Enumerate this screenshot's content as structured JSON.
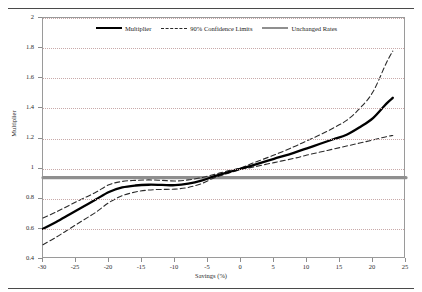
{
  "document": {
    "top_partial_text": "",
    "has_top_rule": true,
    "has_bottom_rule": true
  },
  "legend": {
    "position": "top-inside",
    "entries": [
      {
        "label": "Multiplier",
        "style": "solid",
        "color": "#000000"
      },
      {
        "label": "90% Confidence Limits",
        "style": "dashed",
        "color": "#2b2b2b"
      },
      {
        "label": "Unchanged Rates",
        "style": "thick-solid",
        "color": "#8f8f8f"
      }
    ]
  },
  "chart_data": {
    "type": "line",
    "title": "",
    "xlabel": "Savings (%)",
    "ylabel": "Multiplier",
    "xlim": [
      -30,
      25
    ],
    "ylim": [
      0.4,
      2.0
    ],
    "xticks": [
      -30,
      -25,
      -20,
      -15,
      -10,
      -5,
      0,
      5,
      10,
      15,
      20,
      25
    ],
    "xticklabels": [
      "-30",
      "-25",
      "-20",
      "-15",
      "-10",
      "-5",
      "0",
      "5",
      "10",
      "15",
      "20",
      "25"
    ],
    "yticks": [
      0.4,
      0.6,
      0.8,
      1.0,
      1.2,
      1.4,
      1.6,
      1.8,
      2.0
    ],
    "yticklabels": [
      "0.4",
      "0.6",
      "0.8",
      "1",
      "1.2",
      "1.4",
      "1.6",
      "1.8",
      "2"
    ],
    "grid": "horizontal-dotted",
    "legend_position": "top-inside",
    "series": [
      {
        "name": "Multiplier",
        "style": "solid",
        "color": "#000000",
        "x": [
          -30,
          -28,
          -26,
          -24,
          -22,
          -20,
          -18,
          -16,
          -14,
          -12,
          -10,
          -8,
          -6,
          -4,
          -2,
          0,
          2,
          5,
          8,
          10,
          12,
          14,
          16,
          18,
          20,
          22,
          23
        ],
        "y": [
          0.6,
          0.645,
          0.695,
          0.745,
          0.795,
          0.845,
          0.875,
          0.888,
          0.893,
          0.892,
          0.89,
          0.9,
          0.92,
          0.95,
          0.975,
          1.0,
          1.025,
          1.065,
          1.105,
          1.135,
          1.165,
          1.195,
          1.225,
          1.275,
          1.335,
          1.43,
          1.47
        ]
      },
      {
        "name": "90% Confidence Limits (upper)",
        "style": "dashed",
        "color": "#2b2b2b",
        "x": [
          -30,
          -28,
          -26,
          -24,
          -22,
          -20,
          -18,
          -16,
          -14,
          -12,
          -10,
          -8,
          -6,
          -4,
          -2,
          0,
          2,
          5,
          8,
          10,
          12,
          14,
          16,
          18,
          20,
          22,
          23
        ],
        "y": [
          0.672,
          0.712,
          0.757,
          0.8,
          0.843,
          0.893,
          0.915,
          0.922,
          0.925,
          0.922,
          0.918,
          0.925,
          0.94,
          0.962,
          0.985,
          1.005,
          1.04,
          1.09,
          1.145,
          1.185,
          1.225,
          1.27,
          1.32,
          1.4,
          1.51,
          1.7,
          1.78
        ]
      },
      {
        "name": "90% Confidence Limits (lower)",
        "style": "dashed",
        "color": "#2b2b2b",
        "x": [
          -30,
          -28,
          -26,
          -24,
          -22,
          -20,
          -18,
          -16,
          -14,
          -12,
          -10,
          -8,
          -6,
          -4,
          -2,
          0,
          2,
          5,
          8,
          10,
          12,
          14,
          16,
          18,
          20,
          22,
          23
        ],
        "y": [
          0.495,
          0.545,
          0.6,
          0.655,
          0.71,
          0.775,
          0.82,
          0.845,
          0.858,
          0.862,
          0.864,
          0.875,
          0.9,
          0.94,
          0.968,
          0.995,
          1.012,
          1.04,
          1.068,
          1.09,
          1.11,
          1.13,
          1.15,
          1.17,
          1.19,
          1.212,
          1.22
        ]
      },
      {
        "name": "Unchanged Rates",
        "style": "thick-solid",
        "color": "#8f8f8f",
        "constant_y": 0.94,
        "x": [
          -30,
          25
        ],
        "y": [
          0.94,
          0.94
        ]
      }
    ]
  }
}
